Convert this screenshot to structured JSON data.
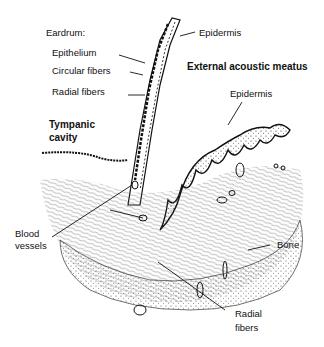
{
  "diagram": {
    "labels": {
      "eardrum": "Eardrum:",
      "epithelium": "Epithelium",
      "circular_fibers": "Circular fibers",
      "radial_fibers_top": "Radial fibers",
      "epidermis_top": "Epidermis",
      "external_meatus": "External acoustic meatus",
      "epidermis_right": "Epidermis",
      "tympanic_cavity_1": "Tympanic",
      "tympanic_cavity_2": "cavity",
      "blood_vessels_1": "Blood",
      "blood_vessels_2": "vessels",
      "bone": "Bone",
      "radial_fibers_bottom_1": "Radial",
      "radial_fibers_bottom_2": "fibers"
    },
    "colors": {
      "ink": "#111111",
      "background": "#ffffff"
    }
  }
}
